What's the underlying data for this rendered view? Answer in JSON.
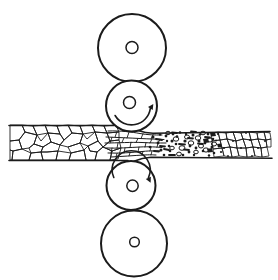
{
  "canvas": {
    "width": 278,
    "height": 280,
    "paper": "#ffffff",
    "ink": "#1b1b1b"
  },
  "diagram": {
    "kind": "four-high-rolling-mill-grain-refinement",
    "rolls": [
      {
        "name": "top-backup-roll",
        "rotation": "none"
      },
      {
        "name": "upper-work-roll",
        "rotation": "counterclockwise"
      },
      {
        "name": "lower-work-roll",
        "rotation": "clockwise"
      },
      {
        "name": "bottom-backup-roll",
        "rotation": "none"
      }
    ],
    "layers": [
      {
        "name": "entry-grain-boundaries",
        "type": "polygons",
        "stroke_w": 0.9,
        "items": [
          "10,125 22,125 25,132 19,140 10,141",
          "22,125 33,126 37,135 25,132",
          "33,126 45,125 48,133 41,141 37,135",
          "45,125 57,126 60,134 48,133",
          "57,126 68,125 72,133 64,140 60,134",
          "68,125 80,126 83,134 72,133",
          "80,126 92,125 95,132 87,139 83,134",
          "92,125 104,126 107,133 95,132",
          "104,126 116,125 119,132 107,133",
          "10,141 19,140 22,149 13,151 10,150",
          "19,140 25,132 37,135 34,144 29,148 22,149",
          "34,144 37,135 48,133 51,142 43,147",
          "29,148 34,144 43,147 41,152 31,153",
          "43,147 51,142 60,145 58,151 47,152 41,152",
          "51,142 48,133 60,134 64,140 60,145",
          "60,145 64,140 72,133 83,134 80,143 68,147",
          "68,147 80,143 84,150 71,153",
          "80,143 83,134 95,132 98,141 88,146",
          "88,146 98,141 103,147 97,152 90,151",
          "98,141 95,132 107,133 110,141 103,147",
          "107,133 119,132 119,140 110,141",
          "103,147 110,141 119,140 121,148 112,151",
          "10,150 13,151 12,160 10,160",
          "13,151 22,149 31,153 29,160 12,160",
          "31,153 41,152 43,160 29,160",
          "41,152 47,152 58,151 56,160 43,160",
          "58,151 71,153 69,160 56,160",
          "71,153 84,150 86,160 69,160",
          "84,150 88,146 90,151 97,152 95,160 86,160",
          "97,152 103,147 112,151 110,160 95,160",
          "112,151 121,148 118,159 110,160"
        ]
      },
      {
        "name": "nip-elongated-grain-flowlines",
        "type": "paths",
        "stroke_w": 1.0,
        "items": [
          "M108,131 C120,130.5 132,132 140,133.5 S154,135 162,135",
          "M106,137 C118,137.5 130,138 140,138.5 S156,139 164,139.5",
          "M105,143 C118,143 132,142 142,142.5 S158,143 166,143",
          "M106,148 C118,148.5 130,147.5 140,147 S156,147 162,147.5",
          "M108,153 C120,153.5 132,152.5 142,151.5 S154,151 160,151",
          "M111,157 C122,156.5 134,155.5 144,155 S152,155 156,155"
        ]
      },
      {
        "name": "nip-grain-cross-ticks",
        "type": "paths",
        "stroke_w": 0.9,
        "items": [
          "M117,131.5 L115,137.2",
          "M129,132.2 L127,138",
          "M143,133.8 L141,138.5",
          "M153,134.8 L151,139",
          "M112,137.3 L110,143",
          "M124,137.8 L122,142.3",
          "M138,138.4 L136,142.4",
          "M152,139 L150,143",
          "M160,139.3 L158,143",
          "M118,143 L117,148.3",
          "M131,142.2 L130,147.6",
          "M146,142.6 L145,147.1",
          "M158,143 L157,147.3",
          "M112,148 L111,153.2",
          "M125,148 L124,153",
          "M139,147.1 L138,151.8",
          "M151,147.2 L150,151",
          "M117,153.3 L116,156.8",
          "M130,152.8 L129,155.8",
          "M143,151.4 L142,155",
          "M152,151 L151,155"
        ]
      },
      {
        "name": "recrystallization-dashes",
        "type": "paths",
        "stroke_w": 1.8,
        "items": [
          "M156,139 L162,140",
          "M164,149 L169,150",
          "M172,132.5 L177,133",
          "M179,144 L185,144.5",
          "M188,138 L193,138.5",
          "M198,143.5 L203,144",
          "M160,146 L165,146.5",
          "M169,155 L175,155",
          "M184,149.5 L189,150",
          "M205,137 L210,137.5",
          "M154,151 L159,151.5",
          "M191,131.5 L196,132"
        ]
      },
      {
        "name": "new-grain-nuclei-ovals",
        "type": "ovals",
        "stroke_w": 1.0,
        "items": [
          [
            176,
            139,
            2.8,
            2.2
          ],
          [
            182,
            148,
            3,
            2.3
          ],
          [
            187,
            137,
            2.5,
            2
          ],
          [
            191,
            143,
            2.8,
            2.2
          ],
          [
            179,
            154,
            2.4,
            1.9
          ],
          [
            198,
            138,
            2.8,
            2.2
          ],
          [
            201,
            146,
            2.5,
            2
          ],
          [
            206,
            150,
            2.8,
            2.1
          ],
          [
            210,
            140,
            2.6,
            2
          ],
          [
            203,
            133,
            2.4,
            1.8
          ],
          [
            214,
            144,
            2.6,
            2
          ],
          [
            196,
            152,
            2.3,
            1.8
          ],
          [
            172,
            148,
            2.3,
            1.8
          ],
          [
            168,
            133,
            2.2,
            1.7
          ]
        ]
      },
      {
        "name": "recrystallization-speck-dots",
        "type": "dots",
        "items": [
          [
            153,
            137,
            1.5
          ],
          [
            158,
            143,
            1.4
          ],
          [
            150,
            147,
            1.3
          ],
          [
            161,
            150,
            1.5
          ],
          [
            166,
            136,
            1.4
          ],
          [
            169,
            146,
            1.3
          ],
          [
            172,
            141,
            1.5
          ],
          [
            164,
            155,
            1.3
          ],
          [
            173,
            134,
            1.4
          ],
          [
            180,
            132.5,
            1.3
          ],
          [
            185,
            141,
            1.6
          ],
          [
            189,
            152,
            1.4
          ],
          [
            193,
            135,
            1.5
          ],
          [
            196,
            148,
            1.4
          ],
          [
            176,
            144,
            1.3
          ],
          [
            183,
            155,
            1.3
          ],
          [
            199,
            141,
            1.5
          ],
          [
            203,
            151,
            1.3
          ],
          [
            208,
            134,
            1.4
          ],
          [
            212,
            147,
            1.5
          ],
          [
            170,
            151,
            1.3
          ],
          [
            177,
            136.5,
            1.3
          ],
          [
            190,
            146,
            1.4
          ],
          [
            200,
            134.5,
            1.3
          ],
          [
            205,
            143,
            1.4
          ],
          [
            214,
            153,
            1.3
          ],
          [
            160,
            134.5,
            1.2
          ],
          [
            167,
            141,
            1.2
          ],
          [
            186,
            134,
            1.2
          ],
          [
            194,
            155,
            1.2
          ],
          [
            209,
            155.5,
            1.2
          ],
          [
            213,
            139,
            1.3
          ],
          [
            218,
            134,
            1.1
          ],
          [
            221,
            152,
            1.1
          ]
        ]
      },
      {
        "name": "dark-transition-grains",
        "type": "filled-polygons",
        "items": [
          "203,139 208,138 209,142.5 204,143",
          "207,149 212,148 213,152 208,152.5",
          "210,132.5 215,132.5 216,136 211,136.5",
          "217,144 221,143.5 222,147 218,147.5"
        ]
      },
      {
        "name": "fine-grain-boundaries",
        "type": "polygons",
        "stroke_w": 0.8,
        "items": [
          "211,133 218,132 220,140 212,141",
          "218,132 226,133 227,139 220,140",
          "226,133 233,132 236,141 227,139",
          "233,132 241,133 243,139 236,141",
          "241,133 249,132 251,140 243,139",
          "249,132 257,133 258,139 251,140",
          "257,133 264,132 266,140 258,139",
          "264,132 270,133 271,139 266,140",
          "212,141 220,140 222,148 213,149",
          "220,140 227,139 230,147 222,148",
          "227,139 236,141 237,148 230,147",
          "236,141 243,139 246,148 237,148",
          "243,139 251,140 253,147 246,148",
          "251,140 258,139 261,148 253,147",
          "258,139 266,140 267,147 261,148",
          "266,140 271,139 271,147 267,147",
          "213,149 222,148 224,156 214,157",
          "222,148 230,147 232,157 224,156",
          "230,147 237,148 239,156 232,157",
          "237,148 246,148 247,157 239,156",
          "246,148 253,147 255,156 247,157",
          "253,147 261,148 262,157 255,156",
          "261,148 267,147 269,156 262,157"
        ]
      },
      {
        "name": "fine-grain-junction-dots",
        "type": "dots",
        "items": [
          [
            216,
            140.5,
            1
          ],
          [
            224,
            148,
            1
          ],
          [
            233,
            141,
            1
          ],
          [
            241,
            148,
            1
          ],
          [
            250,
            140,
            1
          ],
          [
            258,
            148,
            1
          ],
          [
            265,
            141,
            1
          ],
          [
            246,
            133,
            0.9
          ],
          [
            228,
            156,
            0.9
          ],
          [
            252,
            156,
            0.9
          ]
        ]
      },
      {
        "name": "roll-bodies",
        "type": "circles",
        "stroke_w": 2.0,
        "fill": "#ffffff",
        "items": [
          [
            132,
            48,
            34
          ],
          [
            131.5,
            106,
            25.5
          ],
          [
            131,
            185.5,
            24.5
          ],
          [
            134,
            243.5,
            33
          ]
        ]
      },
      {
        "name": "roll-axis-circles",
        "type": "circles",
        "stroke_w": 1.5,
        "fill": "#ffffff",
        "items": [
          [
            132,
            47.5,
            6
          ],
          [
            129.5,
            102.5,
            6
          ],
          [
            132.5,
            185.8,
            5.7
          ],
          [
            134.5,
            242,
            4.8
          ]
        ]
      },
      {
        "name": "strip-outline",
        "type": "paths",
        "stroke_w": 1.6,
        "items": [
          "M9,125.5 L114,125.5",
          "M9,160.5 L128,160.5",
          "M139,130.8 Q145,133.2 153,133.3 L270,131.6",
          "M134,161.2 Q142,157.8 151,157.3 L272,158.2"
        ]
      },
      {
        "name": "rotation-arrow-arcs",
        "type": "paths",
        "stroke_w": 1.6,
        "items": [
          "M115.1,115.5 A19 19 0 0 0 150.3,108.6",
          "M113.8,177.5 A19 19 0 1 1 148.4,177.8"
        ]
      },
      {
        "name": "rotation-arrow-heads",
        "type": "filled-polygons",
        "items": [
          "153.3,104 152.7,110.1 148,107.1",
          "150.6,182.8 150.9,176.7 145.8,179"
        ]
      }
    ]
  }
}
